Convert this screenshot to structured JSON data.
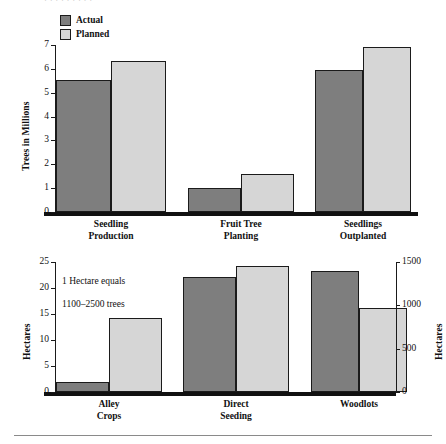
{
  "document": {
    "top_bleed_text": "· ·   ·        ·      ·     ·        ·   ·   ·",
    "divider": "horizontal-rule"
  },
  "legend": {
    "items": [
      {
        "label": "Actual",
        "key": "actual",
        "color": "#7e7e7e"
      },
      {
        "label": "Planned",
        "key": "planned",
        "color": "#d6d6d6"
      }
    ]
  },
  "chart_data": [
    {
      "id": "trees-chart",
      "type": "bar",
      "title": "",
      "xlabel": "",
      "ylabel": "Trees in Millions",
      "ylim": [
        0,
        7
      ],
      "yticks": [
        0,
        1,
        2,
        3,
        4,
        5,
        6,
        7
      ],
      "ytick_labels": [
        "0",
        "1",
        "2",
        "3",
        "4",
        "5",
        "6",
        "7"
      ],
      "grid": false,
      "legend_position": "top-left",
      "categories": [
        "Seedling Production",
        "Fruit Tree Planting",
        "Seedlings Outplanted"
      ],
      "category_lines": [
        [
          "Seedling",
          "Production"
        ],
        [
          "Fruit Tree",
          "Planting"
        ],
        [
          "Seedlings",
          "Outplanted"
        ]
      ],
      "series": [
        {
          "name": "Actual",
          "values": [
            5.55,
            1.0,
            5.95
          ]
        },
        {
          "name": "Planned",
          "values": [
            6.35,
            1.6,
            6.9
          ]
        }
      ]
    },
    {
      "id": "hectares-chart",
      "type": "bar",
      "title": "",
      "xlabel": "",
      "ylabel": "Hectares",
      "ylabel_right": "Hectares",
      "ylim": [
        0,
        25
      ],
      "yticks": [
        0,
        5,
        10,
        15,
        20,
        25
      ],
      "ytick_labels": [
        "0",
        "5",
        "10",
        "15",
        "20",
        "25"
      ],
      "ylim_right": [
        0,
        1500
      ],
      "yticks_right": [
        0,
        500,
        1000,
        1500
      ],
      "ytick_labels_right": [
        "0",
        "500",
        "1000",
        "1500"
      ],
      "grid": false,
      "annotation": "1 Hectare equals\n1100–2500 trees",
      "annotation_lines": [
        "1 Hectare equals",
        "1100–2500 trees"
      ],
      "categories": [
        "Alley Crops",
        "Direct Seeding",
        "Woodlots"
      ],
      "category_lines": [
        [
          "Alley",
          "Crops"
        ],
        [
          "Direct",
          "Seeding"
        ],
        [
          "Woodlots"
        ]
      ],
      "category_axis": [
        "left",
        "left",
        "right"
      ],
      "series": [
        {
          "name": "Actual",
          "values": [
            2.0,
            22.2,
            1400
          ],
          "axis": [
            "left",
            "left",
            "right"
          ]
        },
        {
          "name": "Planned",
          "values": [
            14.3,
            24.2,
            975
          ],
          "axis": [
            "left",
            "left",
            "right"
          ]
        }
      ]
    }
  ]
}
